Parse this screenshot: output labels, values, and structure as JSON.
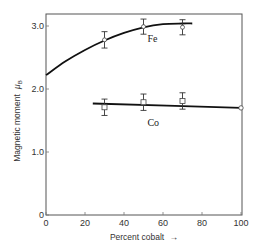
{
  "chart_data": {
    "type": "scatter",
    "title": "",
    "xlabel": "Percent cobalt",
    "xlabel_arrow": "→",
    "ylabel": "Magnetic moment",
    "ylabel_symbol": "μ",
    "ylabel_subscript": "B",
    "xlim": [
      0,
      100
    ],
    "ylim": [
      0,
      3.2
    ],
    "xticks": [
      0,
      20,
      40,
      60,
      80,
      100
    ],
    "xtick_labels": [
      "0",
      "20",
      "40",
      "60",
      "80",
      "100"
    ],
    "yticks": [
      0,
      1.0,
      2.0,
      3.0
    ],
    "ytick_labels": [
      "0",
      "1.0",
      "2.0",
      "3.0"
    ],
    "grid": false,
    "series": [
      {
        "name": "Fe",
        "curve": {
          "x": [
            0,
            10,
            20,
            30,
            40,
            50,
            60,
            70,
            75
          ],
          "y": [
            2.22,
            2.44,
            2.62,
            2.77,
            2.89,
            2.98,
            3.03,
            3.04,
            3.04
          ]
        },
        "points": [
          {
            "x": 30,
            "y": 2.78,
            "err": 0.13
          },
          {
            "x": 50,
            "y": 2.99,
            "err": 0.12
          },
          {
            "x": 70,
            "y": 2.98,
            "err": 0.12
          }
        ],
        "marker": "circle-in-errorbar"
      },
      {
        "name": "Co",
        "curve": {
          "x": [
            24,
            100
          ],
          "y": [
            1.77,
            1.7
          ]
        },
        "points": [
          {
            "x": 30,
            "y": 1.71,
            "err": 0.13
          },
          {
            "x": 50,
            "y": 1.79,
            "err": 0.13
          },
          {
            "x": 70,
            "y": 1.81,
            "err": 0.13
          }
        ],
        "endpoint": {
          "x": 100,
          "y": 1.7
        },
        "marker": "square"
      }
    ],
    "annotations": [
      {
        "text": "Fe",
        "x": 52,
        "y": 2.75
      },
      {
        "text": "Co",
        "x": 52,
        "y": 1.42
      }
    ]
  }
}
